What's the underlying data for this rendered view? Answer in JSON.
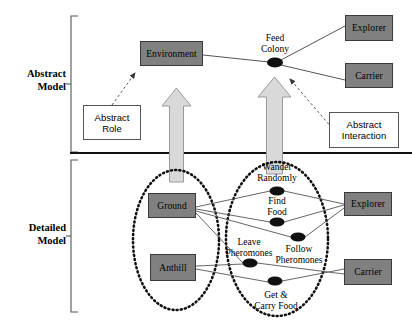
{
  "diagram": {
    "colors": {
      "node_fill": "#808080",
      "node_stroke": "#3a3a3a",
      "arrow_fill": "#d9d9d9",
      "arrow_stroke": "#8a8a8a",
      "line": "#555555",
      "callout_fill": "#ffffff",
      "ellipse_dotted": "#111111",
      "divider": "#111111",
      "bracket": "#555555"
    },
    "sections": [
      {
        "id": "abstract",
        "label": "Abstract\nModel"
      },
      {
        "id": "detailed",
        "label": "Detailed\nModel"
      }
    ],
    "abstract_model": {
      "entities": [
        {
          "id": "environment",
          "label": "Environment"
        },
        {
          "id": "explorer",
          "label": "Explorer"
        },
        {
          "id": "carrier",
          "label": "Carrier"
        }
      ],
      "interaction": {
        "id": "feed-colony",
        "label": "Feed\nColony"
      },
      "callouts": [
        {
          "id": "abstract-role",
          "label": "Abstract\nRole"
        },
        {
          "id": "abstract-interaction",
          "label": "Abstract\nInteraction"
        }
      ]
    },
    "detailed_model": {
      "environment_group": [
        {
          "id": "ground",
          "label": "Ground"
        },
        {
          "id": "anthill",
          "label": "Anthill"
        }
      ],
      "roles": [
        {
          "id": "explorer-detailed",
          "label": "Explorer"
        },
        {
          "id": "carrier-detailed",
          "label": "Carrier"
        }
      ],
      "behaviors": [
        {
          "id": "wander-randomly",
          "label": "Wander\nRandomly"
        },
        {
          "id": "find-food",
          "label": "Find\nFood"
        },
        {
          "id": "follow-pheromones",
          "label": "Follow\nPheromones"
        },
        {
          "id": "leave-pheromones",
          "label": "Leave\nPheromones"
        },
        {
          "id": "get-carry-food",
          "label": "Get &\nCarry Food"
        }
      ]
    }
  }
}
